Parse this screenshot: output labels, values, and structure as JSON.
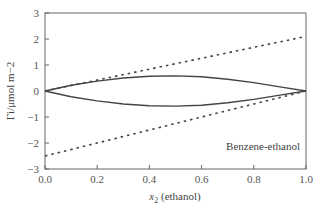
{
  "chart_data": {
    "type": "line",
    "title": "",
    "xlabel": "x2 (ethanol)",
    "xlabel_main": "x",
    "xlabel_sub": "2",
    "xlabel_rest": " (ethanol)",
    "ylabel": "Γi/μmol m−2",
    "xlim": [
      0.0,
      1.0
    ],
    "ylim": [
      -3,
      3
    ],
    "xticks": [
      "0.0",
      "0.2",
      "0.4",
      "0.6",
      "0.8",
      "1.0"
    ],
    "yticks": [
      "3",
      "2",
      "1",
      "0",
      "−1",
      "−2",
      "−3"
    ],
    "grid": false,
    "annotation": "Benzene-ethanol",
    "series": [
      {
        "name": "Γ ethanol (solid)",
        "style": "solid",
        "x": [
          0,
          0.1,
          0.2,
          0.3,
          0.4,
          0.5,
          0.6,
          0.7,
          0.8,
          0.9,
          1.0
        ],
        "y": [
          0,
          0.22,
          0.38,
          0.5,
          0.57,
          0.58,
          0.55,
          0.45,
          0.32,
          0.16,
          0
        ]
      },
      {
        "name": "Γ benzene (solid)",
        "style": "solid",
        "x": [
          0,
          0.1,
          0.2,
          0.3,
          0.4,
          0.5,
          0.6,
          0.7,
          0.8,
          0.9,
          1.0
        ],
        "y": [
          0,
          -0.22,
          -0.38,
          -0.5,
          -0.57,
          -0.58,
          -0.55,
          -0.45,
          -0.32,
          -0.16,
          0
        ]
      },
      {
        "name": "upper dotted",
        "style": "dotted",
        "x": [
          0,
          1.0
        ],
        "y": [
          0,
          2.1
        ]
      },
      {
        "name": "lower dotted",
        "style": "dotted",
        "x": [
          0,
          1.0
        ],
        "y": [
          -2.5,
          0
        ]
      }
    ]
  }
}
